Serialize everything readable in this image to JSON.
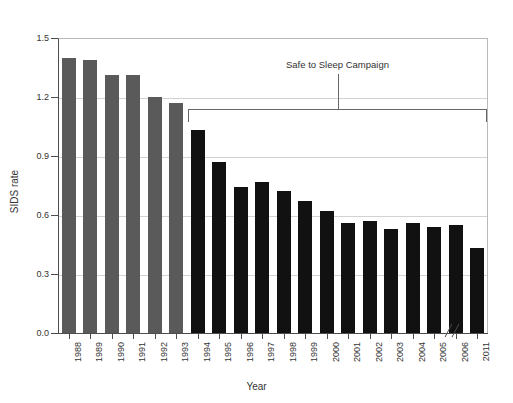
{
  "figure": {
    "caption_remnant": "",
    "annotation": {
      "label": "Safe to Sleep Campaign",
      "span_start": "1994",
      "span_end": "2011"
    }
  },
  "chart_data": {
    "type": "bar",
    "title": "",
    "xlabel": "Year",
    "ylabel": "SIDS rate",
    "ylim": [
      0.0,
      1.5
    ],
    "ytick_labels": [
      "0.0",
      "0.3",
      "0.6",
      "0.9",
      "1.2",
      "1.5"
    ],
    "ytick_values": [
      0.0,
      0.3,
      0.6,
      0.9,
      1.2,
      1.5
    ],
    "grid": "horizontal",
    "legend": "none",
    "axis_break": {
      "present": true,
      "between": [
        "2006",
        "2011"
      ],
      "symbol": "//"
    },
    "categories": [
      "1988",
      "1989",
      "1990",
      "1991",
      "1992",
      "1993",
      "1994",
      "1995",
      "1996",
      "1997",
      "1998",
      "1999",
      "2000",
      "2001",
      "2002",
      "2003",
      "2004",
      "2005",
      "2006",
      "2011"
    ],
    "values": [
      1.4,
      1.39,
      1.31,
      1.31,
      1.2,
      1.17,
      1.03,
      0.87,
      0.74,
      0.77,
      0.72,
      0.67,
      0.62,
      0.56,
      0.57,
      0.53,
      0.56,
      0.54,
      0.55,
      0.43
    ],
    "bar_colors": [
      "#5a5a5a",
      "#5a5a5a",
      "#5a5a5a",
      "#5a5a5a",
      "#5a5a5a",
      "#5a5a5a",
      "#111111",
      "#111111",
      "#111111",
      "#111111",
      "#111111",
      "#111111",
      "#111111",
      "#111111",
      "#111111",
      "#111111",
      "#111111",
      "#111111",
      "#111111",
      "#111111"
    ],
    "colors": {
      "pre_campaign": "#5a5a5a",
      "post_campaign": "#111111",
      "axis": "#4d4d4d",
      "grid": "#d2d2d2"
    },
    "annotations": [
      {
        "text": "Safe to Sleep Campaign",
        "covers": [
          "1994",
          "2011"
        ]
      }
    ]
  }
}
